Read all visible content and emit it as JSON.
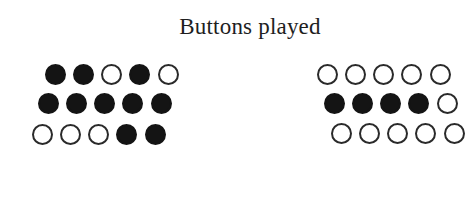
{
  "title": "Buttons played",
  "colors": {
    "filled": "#141414",
    "outline": "#2a2a2a",
    "background": "#ffffff"
  },
  "groups": [
    {
      "name": "left",
      "rows": [
        {
          "y": 74,
          "x0": 55,
          "states": [
            "filled",
            "filled",
            "empty",
            "filled",
            "empty"
          ]
        },
        {
          "y": 103,
          "x0": 48,
          "states": [
            "filled",
            "filled",
            "filled",
            "filled",
            "filled"
          ]
        },
        {
          "y": 134,
          "x0": 42,
          "states": [
            "empty",
            "empty",
            "empty",
            "filled",
            "filled"
          ]
        }
      ]
    },
    {
      "name": "right",
      "rows": [
        {
          "y": 74,
          "x0": 327,
          "states": [
            "empty",
            "empty",
            "empty",
            "empty",
            "empty"
          ]
        },
        {
          "y": 103,
          "x0": 334,
          "states": [
            "filled",
            "filled",
            "filled",
            "filled",
            "empty"
          ]
        },
        {
          "y": 133,
          "x0": 341,
          "states": [
            "empty",
            "empty",
            "empty",
            "empty",
            "empty"
          ]
        }
      ]
    }
  ],
  "spacing": 28.3
}
